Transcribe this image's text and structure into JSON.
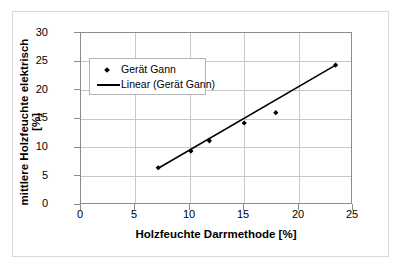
{
  "chart_data": {
    "type": "scatter",
    "title": "",
    "xlabel": "Holzfeuchte Darrmethode [%]",
    "ylabel": "mittlere Holzfeuchte elektrisch [%]",
    "xlim": [
      0,
      25
    ],
    "ylim": [
      0,
      30
    ],
    "xticks": [
      "0",
      "5",
      "10",
      "15",
      "20",
      "25"
    ],
    "yticks": [
      "0",
      "5",
      "10",
      "15",
      "20",
      "25",
      "30"
    ],
    "xtick_values": [
      0,
      5,
      10,
      15,
      20,
      25
    ],
    "ytick_values": [
      0,
      5,
      10,
      15,
      20,
      25,
      30
    ],
    "grid": true,
    "legend_position": "upper left",
    "series": [
      {
        "name": "Gerät Gann",
        "kind": "scatter",
        "marker": "diamond",
        "color": "#000000",
        "x": [
          7.1,
          10.1,
          11.8,
          15.0,
          17.9,
          23.4
        ],
        "y": [
          6.5,
          9.4,
          11.2,
          14.3,
          16.1,
          24.4
        ]
      },
      {
        "name": "Linear (Gerät Gann)",
        "kind": "line",
        "color": "#000000",
        "x": [
          7.1,
          23.4
        ],
        "y": [
          6.4,
          24.4
        ]
      }
    ]
  },
  "legend": {
    "entries": [
      {
        "label": "Gerät Gann",
        "key": "diamond-marker"
      },
      {
        "label": "Linear (Gerät Gann)",
        "key": "line-segment"
      }
    ]
  },
  "colors": {
    "data": "#000000",
    "grid": "#c8c8c8",
    "axis": "#8c8c8c",
    "frame": "#d9d9d9",
    "background": "#ffffff"
  }
}
